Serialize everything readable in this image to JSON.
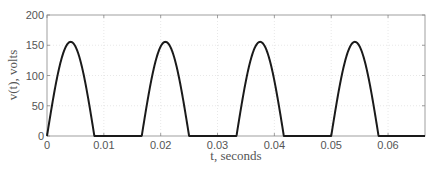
{
  "chart_data": {
    "type": "line",
    "title": "",
    "xlabel": "t, seconds",
    "ylabel": "v(t), volts",
    "xlim": [
      0,
      0.0665
    ],
    "ylim": [
      0,
      200
    ],
    "grid": true,
    "legend": null,
    "xticks": [
      0,
      0.01,
      0.02,
      0.03,
      0.04,
      0.05,
      0.06
    ],
    "xtick_labels": [
      "0",
      "0.01",
      "0.02",
      "0.03",
      "0.04",
      "0.05",
      "0.06"
    ],
    "yticks": [
      0,
      50,
      100,
      150,
      200
    ],
    "ytick_labels": [
      "0",
      "50",
      "100",
      "150",
      "200"
    ],
    "series": [
      {
        "name": "v(t) half-wave rectified sine",
        "color": "#1a1a1a",
        "description": "Half-wave rectified 60 Hz sinusoid, peak ≈ 155.6 V, period ≈ 0.01667 s; positive half-cycle from 0 to ≈0.0083 s, zero otherwise",
        "peak": 155.6,
        "frequency_hz": 60,
        "x": [
          0,
          0.001,
          0.002,
          0.003,
          0.004,
          0.00417,
          0.005,
          0.006,
          0.007,
          0.008,
          0.00833,
          0.01,
          0.012,
          0.014,
          0.016,
          0.01667,
          0.0177,
          0.0187,
          0.0197,
          0.0207,
          0.02083,
          0.0217,
          0.0227,
          0.0237,
          0.0247,
          0.025,
          0.03,
          0.0333,
          0.0343,
          0.0353,
          0.0363,
          0.0373,
          0.0375,
          0.0383,
          0.0393,
          0.0403,
          0.0413,
          0.04167,
          0.045,
          0.05,
          0.051,
          0.052,
          0.053,
          0.054,
          0.05417,
          0.055,
          0.056,
          0.057,
          0.058,
          0.05833,
          0.0665
        ],
        "y": [
          0,
          57.9,
          107.5,
          141.9,
          155.3,
          155.6,
          151.0,
          129.7,
          93.0,
          45.6,
          0,
          0,
          0,
          0,
          0,
          0,
          63.4,
          113.1,
          145.5,
          155.0,
          155.6,
          149.5,
          124.9,
          85.9,
          37.3,
          0,
          0,
          0,
          60.6,
          111.7,
          144.7,
          155.2,
          155.6,
          150.2,
          126.8,
          88.6,
          40.3,
          0,
          0,
          0,
          58.5,
          108.4,
          142.6,
          155.4,
          155.6,
          150.8,
          129.1,
          92.0,
          44.2,
          0,
          0
        ]
      }
    ]
  }
}
